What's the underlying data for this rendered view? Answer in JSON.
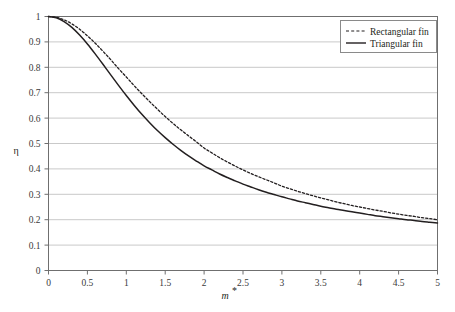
{
  "chart_data": {
    "type": "line",
    "title": "",
    "xlabel": "m*",
    "ylabel": "η",
    "xlim": [
      0,
      5
    ],
    "ylim": [
      0,
      1
    ],
    "grid": "horizontal",
    "legend_position": "top-right",
    "xticks": [
      "0",
      "0.5",
      "1",
      "1.5",
      "2",
      "2.5",
      "3",
      "3.5",
      "4",
      "4.5",
      "5"
    ],
    "xtick_values": [
      0,
      0.5,
      1,
      1.5,
      2,
      2.5,
      3,
      3.5,
      4,
      4.5,
      5
    ],
    "yticks": [
      "0",
      "0.1",
      "0.2",
      "0.3",
      "0.4",
      "0.5",
      "0.6",
      "0.7",
      "0.8",
      "0.9",
      "1"
    ],
    "ytick_values": [
      0,
      0.1,
      0.2,
      0.3,
      0.4,
      0.5,
      0.6,
      0.7,
      0.8,
      0.9,
      1
    ],
    "x": [
      0,
      0.1,
      0.2,
      0.3,
      0.4,
      0.5,
      0.6,
      0.7,
      0.8,
      0.9,
      1.0,
      1.1,
      1.2,
      1.3,
      1.4,
      1.5,
      1.6,
      1.7,
      1.8,
      1.9,
      2.0,
      2.1,
      2.2,
      2.3,
      2.4,
      2.5,
      2.6,
      2.7,
      2.8,
      2.9,
      3.0,
      3.1,
      3.2,
      3.3,
      3.4,
      3.5,
      3.6,
      3.7,
      3.8,
      3.9,
      4.0,
      4.1,
      4.2,
      4.3,
      4.4,
      4.5,
      4.6,
      4.7,
      4.8,
      4.9,
      5.0
    ],
    "series": [
      {
        "name": "Rectangular fin",
        "style": "dashed",
        "color": "#231f20",
        "values": [
          1.0,
          0.997,
          0.987,
          0.971,
          0.95,
          0.924,
          0.895,
          0.863,
          0.83,
          0.795,
          0.762,
          0.728,
          0.696,
          0.665,
          0.635,
          0.606,
          0.579,
          0.554,
          0.53,
          0.507,
          0.482,
          0.463,
          0.444,
          0.427,
          0.411,
          0.396,
          0.382,
          0.369,
          0.357,
          0.345,
          0.332,
          0.322,
          0.312,
          0.303,
          0.294,
          0.286,
          0.278,
          0.27,
          0.263,
          0.256,
          0.25,
          0.244,
          0.238,
          0.233,
          0.227,
          0.222,
          0.217,
          0.213,
          0.208,
          0.204,
          0.2
        ]
      },
      {
        "name": "Triangular fin",
        "style": "solid",
        "color": "#231f20",
        "values": [
          1.0,
          0.995,
          0.98,
          0.957,
          0.927,
          0.892,
          0.853,
          0.812,
          0.77,
          0.729,
          0.689,
          0.651,
          0.615,
          0.582,
          0.551,
          0.523,
          0.497,
          0.473,
          0.451,
          0.431,
          0.412,
          0.396,
          0.38,
          0.366,
          0.353,
          0.34,
          0.329,
          0.318,
          0.308,
          0.299,
          0.29,
          0.282,
          0.274,
          0.267,
          0.26,
          0.253,
          0.247,
          0.241,
          0.236,
          0.231,
          0.226,
          0.221,
          0.216,
          0.212,
          0.208,
          0.204,
          0.2,
          0.197,
          0.193,
          0.19,
          0.187
        ]
      }
    ]
  },
  "legend": {
    "items": [
      {
        "label": "Rectangular fin",
        "style": "dashed"
      },
      {
        "label": "Triangular fin",
        "style": "solid"
      }
    ]
  },
  "axes": {
    "y_title": "η",
    "x_title_base": "m",
    "x_title_sup": "*"
  },
  "colors": {
    "background": "#ffffff",
    "axis": "#6f6f6f",
    "grid": "#c9c9c9",
    "curve": "#231f20",
    "legend_border": "#8a8a8a",
    "tick_text": "#3a3a3a"
  }
}
